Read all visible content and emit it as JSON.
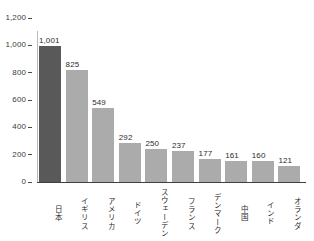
{
  "chart_data": {
    "type": "bar",
    "title": "",
    "subtitle": "",
    "xlabel": "",
    "ylabel": "",
    "categories": [
      "日本",
      "イギリス",
      "アメリカ",
      "ドイツ",
      "スウェーデン",
      "フランス",
      "デンマーク",
      "中国",
      "インド",
      "オランダ"
    ],
    "values": [
      1001,
      825,
      549,
      292,
      250,
      237,
      177,
      161,
      160,
      121
    ],
    "value_labels": [
      "1,001",
      "825",
      "549",
      "292",
      "250",
      "237",
      "177",
      "161",
      "160",
      "121"
    ],
    "ylim": [
      0,
      1200
    ],
    "yticks": [
      0,
      200,
      400,
      600,
      800,
      1000,
      1200
    ],
    "ytick_labels": [
      "0",
      "200",
      "400",
      "600",
      "800",
      "1,000",
      "1,200"
    ],
    "grid": false,
    "legend": false,
    "legend_position": "none",
    "highlight_index": 0,
    "colors": {
      "bar_default": "#ababab",
      "bar_highlight": "#595959",
      "axis": "#404040",
      "axis_spine": "#b9b9b9",
      "text": "#2b2b2b",
      "background": "#ffffff"
    }
  }
}
